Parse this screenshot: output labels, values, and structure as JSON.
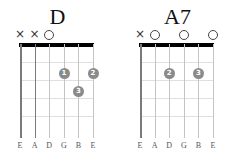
{
  "chords": [
    {
      "name": "D",
      "strings": [
        "E",
        "A",
        "D",
        "G",
        "B",
        "E"
      ],
      "markers": [
        "x",
        "x",
        "o",
        "",
        "",
        ""
      ],
      "dots": [
        {
          "string": 3,
          "fret": 2,
          "finger": "1"
        },
        {
          "string": 5,
          "fret": 2,
          "finger": "2"
        },
        {
          "string": 4,
          "fret": 3,
          "finger": "3"
        }
      ],
      "dark_strings": [
        0,
        1
      ]
    },
    {
      "name": "A7",
      "strings": [
        "E",
        "A",
        "D",
        "G",
        "B",
        "E"
      ],
      "markers": [
        "x",
        "o",
        "",
        "o",
        "",
        "o"
      ],
      "dots": [
        {
          "string": 2,
          "fret": 2,
          "finger": "2"
        },
        {
          "string": 4,
          "fret": 2,
          "finger": "3"
        }
      ],
      "dark_strings": [
        0
      ]
    }
  ],
  "colors": {
    "dot": "#8a8a8a",
    "nut": "#000000",
    "string": "#c4c4c4",
    "muted_string": "#7a7a7a",
    "fret": "#e0e0e0"
  }
}
